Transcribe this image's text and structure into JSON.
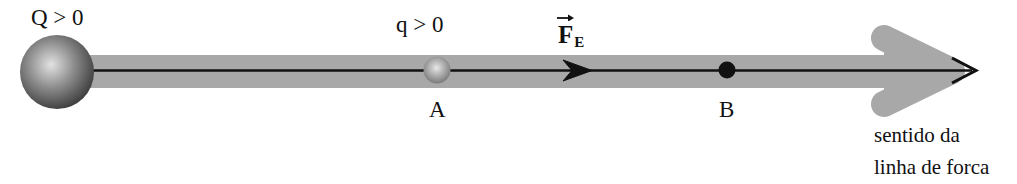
{
  "figure": {
    "colors": {
      "band_gray": "#a8a8a8",
      "arrowhead_gray": "#a8a8a8",
      "line_black": "#111111",
      "sphere_dark": "#4a4a4a",
      "sphere_light": "#d8d8d8",
      "background": "#ffffff"
    },
    "source_charge": {
      "label": "Q > 0",
      "name": "source-charge-sphere",
      "cx": 57,
      "cy": 72,
      "r": 37
    },
    "test_charge": {
      "label": "q > 0",
      "point_label": "A",
      "name": "test-charge-sphere",
      "cx": 437,
      "cy": 70,
      "r": 13
    },
    "point_b": {
      "label": "B",
      "name": "point-b-dot",
      "cx": 727,
      "cy": 70,
      "r": 8
    },
    "force_vector": {
      "symbol": "F",
      "subscript": "E",
      "description": "Forca eletrica sobre a carga de prova"
    },
    "field_line": {
      "caption_line1": "sentido da",
      "caption_line2": "linha de forca",
      "y": 70,
      "x_start": 57,
      "x_end": 975
    }
  }
}
